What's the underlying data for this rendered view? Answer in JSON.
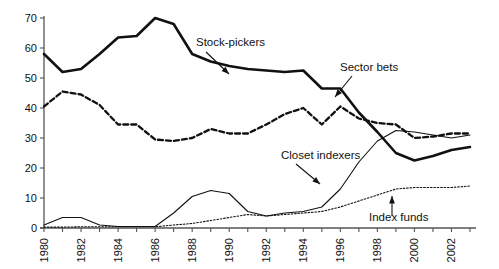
{
  "chart_data": {
    "type": "line",
    "title": "",
    "subtitle": "",
    "xlabel": "",
    "ylabel": "",
    "xlim": [
      1980,
      2003
    ],
    "ylim": [
      0,
      70
    ],
    "grid": false,
    "legend_position": "inline-annotations",
    "ytick_labels": [
      "0",
      "10",
      "20",
      "30",
      "40",
      "50",
      "60",
      "70"
    ],
    "ytick_values": [
      0,
      10,
      20,
      30,
      40,
      50,
      60,
      70
    ],
    "xtick_values": [
      1980,
      1981,
      1982,
      1983,
      1984,
      1985,
      1986,
      1987,
      1988,
      1989,
      1990,
      1991,
      1992,
      1993,
      1994,
      1995,
      1996,
      1997,
      1998,
      1999,
      2000,
      2001,
      2002,
      2003
    ],
    "xtick_labels_shown": [
      "1980",
      "1982",
      "1984",
      "1986",
      "1988",
      "1990",
      "1992",
      "1994",
      "1996",
      "1998",
      "2000",
      "2002"
    ],
    "x": [
      1980,
      1981,
      1982,
      1983,
      1984,
      1985,
      1986,
      1987,
      1988,
      1989,
      1990,
      1991,
      1992,
      1993,
      1994,
      1995,
      1996,
      1997,
      1998,
      1999,
      2000,
      2001,
      2002,
      2003
    ],
    "series": [
      {
        "name": "Stock-pickers",
        "style": "thick-solid",
        "values": [
          58,
          52,
          53,
          58,
          63.5,
          64,
          70,
          68,
          58,
          55.5,
          54,
          53,
          52.5,
          52,
          52.5,
          46.5,
          46.5,
          38.5,
          32,
          25,
          22.5,
          24,
          26,
          27
        ]
      },
      {
        "name": "Sector bets",
        "style": "dashed",
        "values": [
          40.5,
          45.5,
          44.5,
          41,
          34.5,
          34.5,
          29.5,
          29,
          30,
          33,
          31.5,
          31.5,
          34.5,
          38,
          40,
          34.5,
          40.5,
          36.5,
          35,
          34.5,
          30,
          30.5,
          31.5,
          31.5
        ]
      },
      {
        "name": "Closet indexers",
        "style": "thin-solid",
        "values": [
          1,
          3.5,
          3.5,
          1,
          0.5,
          0.5,
          0.5,
          5,
          10.5,
          12.5,
          11.5,
          5.5,
          4,
          5,
          5.5,
          7,
          13,
          22,
          29,
          32.5,
          32,
          31,
          30,
          31
        ]
      },
      {
        "name": "Index funds",
        "style": "dotted",
        "values": [
          0.3,
          0.3,
          0.4,
          0.4,
          0.4,
          0.4,
          0.4,
          1,
          1.5,
          2.5,
          3.5,
          4.5,
          4,
          4.5,
          5,
          5.5,
          7,
          9,
          11,
          13,
          13.5,
          13.5,
          13.5,
          14
        ]
      }
    ],
    "annotations": [
      {
        "label": "Stock-pickers",
        "series": "Stock-pickers"
      },
      {
        "label": "Sector bets",
        "series": "Sector bets"
      },
      {
        "label": "Closet indexers",
        "series": "Closet indexers"
      },
      {
        "label": "Index funds",
        "series": "Index funds"
      }
    ],
    "colors": {
      "axis": "#555555",
      "line": "#111111",
      "background": "#ffffff"
    }
  }
}
